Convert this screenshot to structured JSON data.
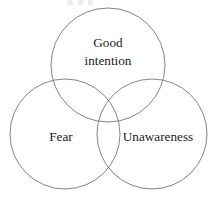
{
  "figure": {
    "type": "venn-diagram",
    "title": "",
    "background_color": "#ffffff",
    "stroke_color": "#6e6e6e",
    "text_color": "#1a1a1a",
    "set_count": 3
  },
  "sets": [
    {
      "id": "good-intention",
      "label": "Good intention",
      "label_lines": [
        "Good",
        "intention"
      ],
      "position": "top",
      "center_x": 108,
      "center_y": 65,
      "radius": 57,
      "label_x": 108,
      "label_line1_y": 47,
      "label_line2_y": 65
    },
    {
      "id": "fear",
      "label": "Fear",
      "label_lines": [
        "Fear"
      ],
      "position": "bottom-left",
      "center_x": 65,
      "center_y": 134,
      "radius": 55,
      "label_x": 61,
      "label_line1_y": 141
    },
    {
      "id": "unawareness",
      "label": "Unawareness",
      "label_lines": [
        "Unawareness"
      ],
      "position": "bottom-right",
      "center_x": 152,
      "center_y": 134,
      "radius": 55,
      "label_x": 158,
      "label_line1_y": 141
    }
  ],
  "artifact": {
    "name": "clipped-text-fragment",
    "description": "faint partial glyph row clipped at the top edge"
  }
}
